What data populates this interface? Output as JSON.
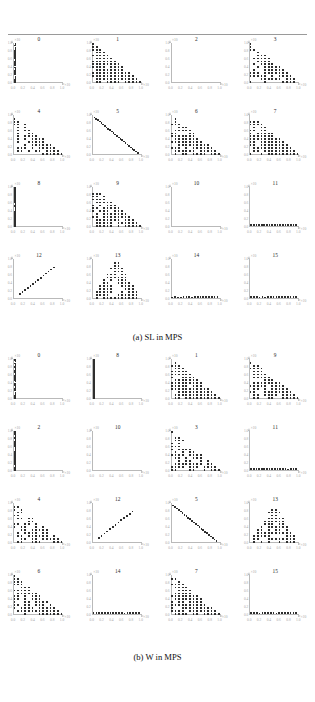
{
  "figure": {
    "panels": [
      {
        "id": "panel-a",
        "caption": "(a) SL in MPS",
        "subplot_titles": [
          "0",
          "1",
          "2",
          "3",
          "4",
          "5",
          "6",
          "7",
          "8",
          "9",
          "10",
          "11",
          "12",
          "13",
          "14",
          "15"
        ]
      },
      {
        "id": "panel-b",
        "caption": "(b) W in MPS",
        "subplot_titles": [
          "0",
          "8",
          "1",
          "9",
          "2",
          "10",
          "3",
          "11",
          "4",
          "12",
          "5",
          "13",
          "6",
          "14",
          "7",
          "15"
        ]
      }
    ],
    "axis": {
      "xtick_labels": [
        "0.0",
        "0.2",
        "0.4",
        "0.6",
        "0.8",
        "1.0"
      ],
      "ytick_labels": [
        "1.0",
        "0.8",
        "0.6",
        "0.4",
        "0.2",
        "0.0"
      ],
      "x_exponent": "×10",
      "y_exponent": "×10",
      "xlim": [
        0.0,
        1.0
      ],
      "ylim": [
        0.0,
        1.0
      ],
      "marker_color": "#2e2e2e",
      "axis_color": "#b9b9b9",
      "tick_label_color": "#a8a8a8"
    }
  },
  "chart_data": {
    "type": "scatter",
    "title": "",
    "subtitle": "",
    "xlabel": "",
    "ylabel": "",
    "xlim": [
      0.0,
      1.0
    ],
    "ylim": [
      0.0,
      1.0
    ],
    "grid": false,
    "legend": "none",
    "panels": [
      {
        "name": "(a) SL in MPS",
        "layout": [
          4,
          4
        ],
        "subplots": [
          {
            "title": "0",
            "shape": "vertical-line-left",
            "n_points": 22,
            "note": "dense column of markers along x≈0, spanning full y range"
          },
          {
            "title": "1",
            "shape": "filled-triangle-descending",
            "n_points": 96,
            "note": "dense simplex: points fill region under line y = 1 - x, thinning toward lower right"
          },
          {
            "title": "2",
            "shape": "empty",
            "n_points": 0,
            "note": "no visible markers"
          },
          {
            "title": "3",
            "shape": "filled-triangle-descending",
            "n_points": 70,
            "note": "triangular band under y = 1 - x"
          },
          {
            "title": "4",
            "shape": "filled-triangle-descending",
            "n_points": 62,
            "note": "compact triangle in upper-left region"
          },
          {
            "title": "5",
            "shape": "diagonal-line-descending",
            "n_points": 26,
            "note": "single anti-diagonal streak from upper-left to lower-right"
          },
          {
            "title": "6",
            "shape": "filled-triangle-descending",
            "n_points": 80,
            "note": "dense simplex fill"
          },
          {
            "title": "7",
            "shape": "filled-triangle-descending",
            "n_points": 88,
            "note": "dense simplex fill"
          },
          {
            "title": "8",
            "shape": "vertical-line-left",
            "n_points": 20,
            "note": "column of markers at x≈0"
          },
          {
            "title": "9",
            "shape": "filled-triangle-descending",
            "n_points": 84,
            "note": "dense simplex fill"
          },
          {
            "title": "10",
            "shape": "empty",
            "n_points": 0,
            "note": "no visible markers"
          },
          {
            "title": "11",
            "shape": "horizontal-line-bottom",
            "n_points": 18,
            "note": "row of markers along y≈0"
          },
          {
            "title": "12",
            "shape": "diagonal-line-ascending",
            "n_points": 14,
            "note": "short rising diagonal streak"
          },
          {
            "title": "13",
            "shape": "filled-triangle-peaked",
            "n_points": 78,
            "note": "mound / pyramid shaped cloud centered on x≈0.5"
          },
          {
            "title": "14",
            "shape": "horizontal-line-bottom",
            "n_points": 17,
            "note": "row of markers along y≈0"
          },
          {
            "title": "15",
            "shape": "horizontal-line-bottom",
            "n_points": 17,
            "note": "row of markers along y≈0"
          }
        ]
      },
      {
        "name": "(b) W in MPS",
        "layout": [
          4,
          4
        ],
        "subplots": [
          {
            "title": "0",
            "shape": "vertical-line-left",
            "n_points": 22,
            "note": "column of markers at x≈0"
          },
          {
            "title": "8",
            "shape": "vertical-line-left",
            "n_points": 20,
            "note": "column of markers at x≈0"
          },
          {
            "title": "1",
            "shape": "filled-triangle-descending",
            "n_points": 92,
            "note": "dense simplex under y = 1 - x"
          },
          {
            "title": "9",
            "shape": "filled-triangle-descending",
            "n_points": 76,
            "note": "dense simplex under y = 1 - x"
          },
          {
            "title": "2",
            "shape": "vertical-line-left",
            "n_points": 20,
            "note": "column of markers at x≈0"
          },
          {
            "title": "10",
            "shape": "empty",
            "n_points": 0,
            "note": "no visible markers"
          },
          {
            "title": "3",
            "shape": "filled-triangle-descending",
            "n_points": 68,
            "note": "triangular fill, sparser lattice"
          },
          {
            "title": "11",
            "shape": "horizontal-line-bottom",
            "n_points": 18,
            "note": "row of markers along y≈0"
          },
          {
            "title": "4",
            "shape": "filled-triangle-descending",
            "n_points": 64,
            "note": "compact triangle upper-left"
          },
          {
            "title": "12",
            "shape": "diagonal-line-ascending",
            "n_points": 13,
            "note": "short rising diagonal streak"
          },
          {
            "title": "5",
            "shape": "diagonal-line-descending",
            "n_points": 24,
            "note": "anti-diagonal streak"
          },
          {
            "title": "13",
            "shape": "filled-triangle-peaked",
            "n_points": 72,
            "note": "mound shaped cloud centered on x≈0.5"
          },
          {
            "title": "6",
            "shape": "filled-triangle-descending",
            "n_points": 80,
            "note": "dense simplex fill"
          },
          {
            "title": "14",
            "shape": "horizontal-line-bottom",
            "n_points": 17,
            "note": "row of markers along y≈0"
          },
          {
            "title": "7",
            "shape": "filled-triangle-descending",
            "n_points": 86,
            "note": "dense simplex fill"
          },
          {
            "title": "15",
            "shape": "horizontal-line-bottom",
            "n_points": 17,
            "note": "row of markers along y≈0"
          }
        ]
      }
    ]
  }
}
